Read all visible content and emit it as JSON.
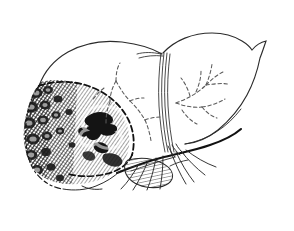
{
  "figure": {
    "title": "Liver with nodular tumor infiltration of the left lobe",
    "medium": "pen-and-ink line drawing",
    "palette": {
      "ink": "#1a1a1a",
      "hatch_gray": "#4a4a4a",
      "paper": "#ffffff",
      "frame": "#a8a8a8"
    },
    "frame": {
      "visible": true,
      "stroke": "#a8a8a8",
      "thickness_px": 1,
      "inset_px": 6
    }
  },
  "structures": [
    {
      "id": "right-lobe",
      "label": "Right hepatic lobe",
      "rendering": "clean outline, unshaded",
      "interactable": false
    },
    {
      "id": "left-lobe",
      "label": "Left hepatic lobe",
      "rendering": "clean outline, unshaded superior portion",
      "interactable": false
    },
    {
      "id": "tumor-region",
      "label": "Nodular tumor / cut surface of left lobe",
      "rendering": "dense stipple and cross-hatch, dark irregular nodules",
      "interactable": false
    },
    {
      "id": "falciform-ligament",
      "label": "Falciform ligament",
      "rendering": "multiple parallel vertical lines between lobes",
      "interactable": false
    },
    {
      "id": "dashed-vessels-right",
      "label": "Intrahepatic vascular branches (right lobe)",
      "rendering": "dashed branching lines",
      "interactable": false
    },
    {
      "id": "dashed-vessels-left",
      "label": "Intrahepatic vascular branches (left lobe)",
      "rendering": "dashed branching lines",
      "interactable": false
    },
    {
      "id": "resection-margin",
      "label": "Resection / demarcation margin",
      "rendering": "heavy dashed curve bounding the tumor region",
      "interactable": false
    },
    {
      "id": "gallbladder",
      "label": "Gallbladder",
      "rendering": "hatched oblong body below inferior liver border",
      "interactable": false
    },
    {
      "id": "hilar-vessels",
      "label": "Hepatoduodenal ligament vessels (portal vein, hepatic artery, bile duct)",
      "rendering": "fine converging curved lines below the hilum",
      "interactable": false
    },
    {
      "id": "inferior-border",
      "label": "Inferior hepatic border",
      "rendering": "thick dark sweeping line",
      "interactable": false
    }
  ],
  "annotations": {
    "text_labels": [],
    "legend": [],
    "caption": ""
  }
}
